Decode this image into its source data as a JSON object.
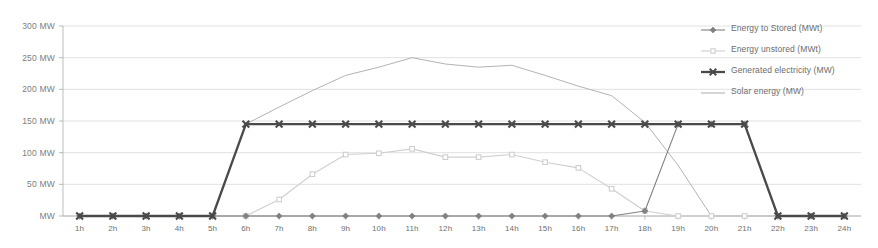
{
  "chart_data": {
    "type": "line",
    "title": "",
    "xlabel": "",
    "ylabel": "",
    "grid": true,
    "legend_position": "right",
    "ylim": [
      0,
      300
    ],
    "yticks": [
      0,
      50,
      100,
      150,
      200,
      250,
      300
    ],
    "ytick_labels": [
      "MW",
      "50 MW",
      "100 MW",
      "150 MW",
      "200 MW",
      "250 MW",
      "300 MW"
    ],
    "x": [
      "1h",
      "2h",
      "3h",
      "4h",
      "5h",
      "6h",
      "7h",
      "8h",
      "9h",
      "10h",
      "11h",
      "12h",
      "13h",
      "14h",
      "15h",
      "16h",
      "17h",
      "18h",
      "19h",
      "20h",
      "21h",
      "22h",
      "23h",
      "24h"
    ],
    "series": [
      {
        "name": "Energy to Stored (MWt)",
        "color": "#808080",
        "marker": "diamond",
        "values": [
          0,
          0,
          0,
          0,
          0,
          0,
          0,
          0,
          0,
          0,
          0,
          0,
          0,
          0,
          0,
          0,
          0,
          8,
          145,
          145,
          145,
          0,
          0,
          0
        ]
      },
      {
        "name": "Energy unstored (MWt)",
        "color": "#cfcfcf",
        "marker": "square",
        "values": [
          0,
          0,
          0,
          0,
          0,
          0,
          26,
          66,
          97,
          99,
          106,
          93,
          93,
          97,
          85,
          76,
          43,
          8,
          0,
          0,
          0,
          0,
          0,
          0
        ]
      },
      {
        "name": "Generated electricity (MW)",
        "color": "#4a4a4a",
        "marker": "x",
        "values": [
          0,
          0,
          0,
          0,
          0,
          145,
          145,
          145,
          145,
          145,
          145,
          145,
          145,
          145,
          145,
          145,
          145,
          145,
          145,
          145,
          145,
          0,
          0,
          0
        ]
      },
      {
        "name": "Solar energy (MW)",
        "color": "#b3b3b3",
        "marker": "none",
        "values": [
          0,
          0,
          0,
          0,
          0,
          145,
          172,
          198,
          222,
          235,
          250,
          240,
          235,
          238,
          222,
          205,
          190,
          148,
          80,
          0,
          0,
          0,
          0,
          0
        ]
      }
    ]
  }
}
